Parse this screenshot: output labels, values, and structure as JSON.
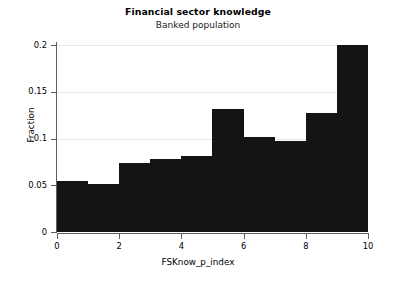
{
  "chart_data": {
    "type": "bar",
    "title": "Financial sector knowledge",
    "subtitle": "Banked population",
    "xlabel": "FSKnow_p_index",
    "ylabel": "Fraction",
    "categories": [
      "0-1",
      "1-2",
      "2-3",
      "3-4",
      "4-5",
      "5-6",
      "6-7",
      "7-8",
      "8-9",
      "9-10"
    ],
    "bin_edges": [
      0,
      1,
      2,
      3,
      4,
      5,
      6,
      7,
      8,
      9,
      10
    ],
    "values": [
      0.0545,
      0.0513,
      0.0738,
      0.0781,
      0.0813,
      0.1313,
      0.1013,
      0.0975,
      0.1275,
      0.2
    ],
    "xlim": [
      0,
      10
    ],
    "ylim": [
      0,
      0.2
    ],
    "xticks": [
      "0",
      "2",
      "4",
      "6",
      "8",
      "10"
    ],
    "xtick_values": [
      0,
      2,
      4,
      6,
      8,
      10
    ],
    "yticks": [
      "0",
      "0.05",
      "0.1",
      "0.15",
      "0.2"
    ],
    "ytick_values": [
      0,
      0.05,
      0.1,
      0.15,
      0.2
    ],
    "grid": "horizontal",
    "legend": "none",
    "bar_color": "#141414",
    "grid_color": "#e8e8e8",
    "axis_color": "#5f5f5f",
    "background": "#ffffff"
  }
}
